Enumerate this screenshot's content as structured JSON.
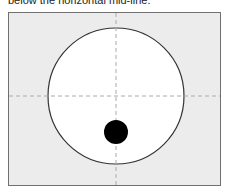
{
  "caption": "below the horizontal mid-line.",
  "diagram": {
    "frame_bg": "#ececec",
    "frame_border": "#707070",
    "circle": {
      "cx": 116,
      "cy": 96,
      "r": 68,
      "fill": "#ffffff",
      "stroke": "#333333"
    },
    "crosshair": {
      "stroke": "#aaaaaa",
      "style": "dashed"
    },
    "dot": {
      "cx": 116,
      "cy": 132,
      "r": 12,
      "fill": "#000000"
    }
  }
}
